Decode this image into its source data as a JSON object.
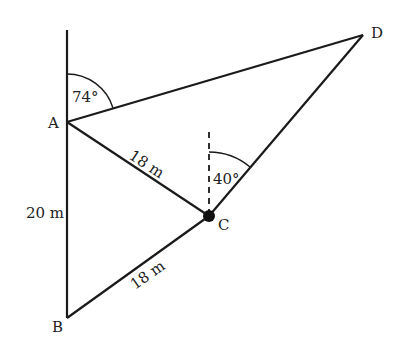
{
  "diagram": {
    "points": {
      "A": {
        "label": "A",
        "x": 67,
        "y": 122
      },
      "B": {
        "label": "B",
        "x": 67,
        "y": 318
      },
      "C": {
        "label": "C",
        "x": 209,
        "y": 216
      },
      "D": {
        "label": "D",
        "x": 363,
        "y": 35
      }
    },
    "labels": {
      "angle_A": "74°",
      "angle_C": "40°",
      "AB": "20 m",
      "AC": "18 m",
      "BC": "18 m"
    },
    "colors": {
      "line": "#1a1a1a",
      "text": "#222222"
    }
  }
}
